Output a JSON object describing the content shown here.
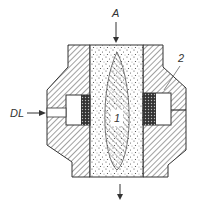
{
  "diagram": {
    "labels": {
      "inlet_top": "A",
      "side_inlet": "DL",
      "core": "1",
      "housing": "2"
    },
    "colors": {
      "line": "#333333",
      "hatch": "#444444",
      "mesh": "#333333",
      "background": "#ffffff"
    }
  }
}
